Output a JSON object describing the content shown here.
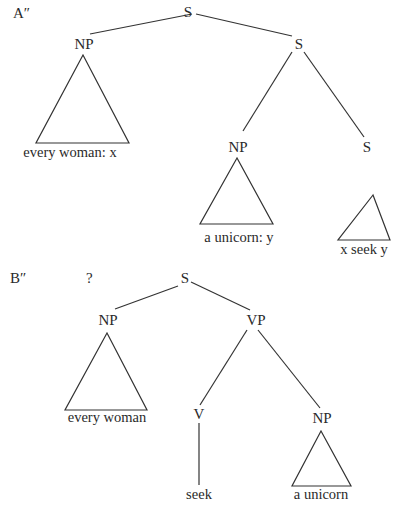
{
  "diagram_a": {
    "label": "A″",
    "root": "S",
    "np1": "NP",
    "np1_leaf": "every woman: x",
    "s2": "S",
    "np2": "NP",
    "np2_leaf": "a unicorn: y",
    "s3": "S",
    "s3_leaf": "x seek y"
  },
  "diagram_b": {
    "label": "B″",
    "mark": "?",
    "root": "S",
    "np1": "NP",
    "np1_leaf": "every woman",
    "vp": "VP",
    "v": "V",
    "v_leaf": "seek",
    "np2": "NP",
    "np2_leaf": "a unicorn"
  },
  "colors": {
    "ink": "#2a2a2a",
    "background": "#ffffff"
  }
}
